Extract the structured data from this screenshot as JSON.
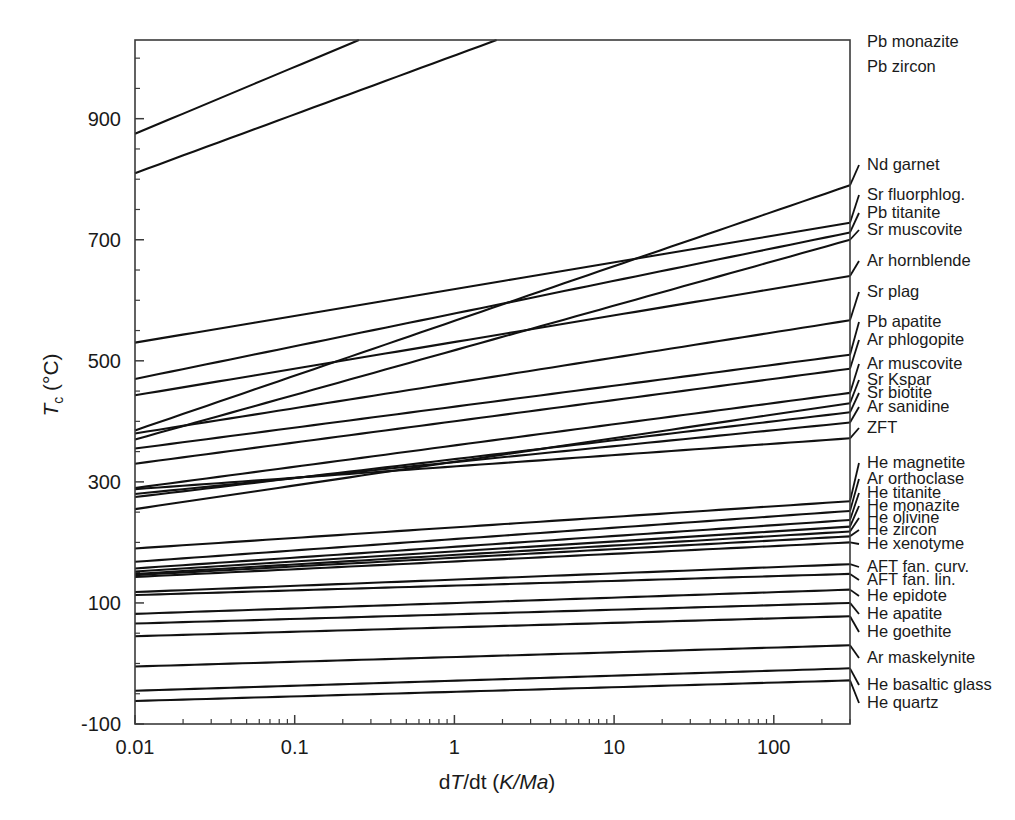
{
  "chart_data": {
    "type": "line",
    "title": "",
    "xlabel": "dT/dt (K/Ma)",
    "ylabel": "Tc (°C)",
    "xscale": "log",
    "xlim": [
      0.01,
      300
    ],
    "ylim": [
      -100,
      1030
    ],
    "grid": false,
    "legend_position": "right-axis-inline",
    "x_ticklabels": [
      "0.01",
      "0.1",
      "1",
      "10",
      "100"
    ],
    "x_tickvalues": [
      0.01,
      0.1,
      1,
      10,
      100
    ],
    "y_ticklabels": [
      "-100",
      "100",
      "300",
      "500",
      "700",
      "900"
    ],
    "y_tickvalues": [
      -100,
      100,
      300,
      500,
      700,
      900
    ],
    "y_minor_step": 50,
    "annotations": [],
    "series": [
      {
        "name": "Pb monazite",
        "label": "Pb monazite",
        "y_at_0.01": 875,
        "y_at_300": 1370,
        "clipped_top": true
      },
      {
        "name": "Pb zircon",
        "label": "Pb zircon",
        "y_at_0.01": 810,
        "y_at_300": 1245,
        "clipped_top": true
      },
      {
        "name": "Nd garnet",
        "label": "Nd garnet",
        "y_at_0.01": 385,
        "y_at_300": 790,
        "clipped_top": false
      },
      {
        "name": "Sr fluorphlog.",
        "label": "Sr fluorphlog.",
        "y_at_0.01": 530,
        "y_at_300": 728,
        "clipped_top": false
      },
      {
        "name": "Pb titanite",
        "label": "Pb titanite",
        "y_at_0.01": 470,
        "y_at_300": 712,
        "clipped_top": false
      },
      {
        "name": "Sr muscovite",
        "label": "Sr muscovite",
        "y_at_0.01": 370,
        "y_at_300": 700,
        "clipped_top": false
      },
      {
        "name": "Ar hornblende",
        "label": "Ar hornblende",
        "y_at_0.01": 443,
        "y_at_300": 640,
        "clipped_top": false
      },
      {
        "name": "Sr plag",
        "label": "Sr plag",
        "y_at_0.01": 380,
        "y_at_300": 567,
        "clipped_top": false
      },
      {
        "name": "Pb apatite",
        "label": "Pb apatite",
        "y_at_0.01": 355,
        "y_at_300": 510,
        "clipped_top": false
      },
      {
        "name": "Ar phlogopite",
        "label": "Ar phlogopite",
        "y_at_0.01": 330,
        "y_at_300": 487,
        "clipped_top": false
      },
      {
        "name": "Ar muscovite",
        "label": "Ar muscovite",
        "y_at_0.01": 290,
        "y_at_300": 447,
        "clipped_top": false
      },
      {
        "name": "Sr Kspar",
        "label": "Sr Kspar",
        "y_at_0.01": 255,
        "y_at_300": 430,
        "clipped_top": false
      },
      {
        "name": "Sr biotite",
        "label": "Sr biotite",
        "y_at_0.01": 275,
        "y_at_300": 415,
        "clipped_top": false
      },
      {
        "name": "Ar sanidine",
        "label": "Ar sanidine",
        "y_at_0.01": 280,
        "y_at_300": 398,
        "clipped_top": false
      },
      {
        "name": "ZFT",
        "label": "ZFT",
        "y_at_0.01": 288,
        "y_at_300": 372,
        "clipped_top": false
      },
      {
        "name": "He magnetite",
        "label": "He magnetite",
        "y_at_0.01": 190,
        "y_at_300": 268,
        "clipped_top": false
      },
      {
        "name": "Ar orthoclase",
        "label": "Ar orthoclase",
        "y_at_0.01": 168,
        "y_at_300": 252,
        "clipped_top": false
      },
      {
        "name": "He titanite",
        "label": "He titanite",
        "y_at_0.01": 157,
        "y_at_300": 237,
        "clipped_top": false
      },
      {
        "name": "He monazite",
        "label": "He monazite",
        "y_at_0.01": 152,
        "y_at_300": 226,
        "clipped_top": false
      },
      {
        "name": "He olivine",
        "label": "He olivine",
        "y_at_0.01": 148,
        "y_at_300": 218,
        "clipped_top": false
      },
      {
        "name": "He zircon",
        "label": "He zircon",
        "y_at_0.01": 146,
        "y_at_300": 210,
        "clipped_top": false
      },
      {
        "name": "He xenotyme",
        "label": "He xenotyme",
        "y_at_0.01": 143,
        "y_at_300": 200,
        "clipped_top": false
      },
      {
        "name": "AFT fan. curv.",
        "label": "AFT fan. curv.",
        "y_at_0.01": 118,
        "y_at_300": 164,
        "clipped_top": false
      },
      {
        "name": "AFT fan. lin.",
        "label": "AFT fan. lin.",
        "y_at_0.01": 113,
        "y_at_300": 148,
        "clipped_top": false
      },
      {
        "name": "He epidote",
        "label": "He epidote",
        "y_at_0.01": 82,
        "y_at_300": 122,
        "clipped_top": false
      },
      {
        "name": "He apatite",
        "label": "He apatite",
        "y_at_0.01": 66,
        "y_at_300": 100,
        "clipped_top": false
      },
      {
        "name": "He goethite",
        "label": "He goethite",
        "y_at_0.01": 45,
        "y_at_300": 78,
        "clipped_top": false
      },
      {
        "name": "Ar maskelynite",
        "label": "Ar maskelynite",
        "y_at_0.01": -5,
        "y_at_300": 30,
        "clipped_top": false
      },
      {
        "name": "He basaltic glass",
        "label": "He basaltic glass",
        "y_at_0.01": -45,
        "y_at_300": -8,
        "clipped_top": false
      },
      {
        "name": "He quartz",
        "label": "He quartz",
        "y_at_0.01": -62,
        "y_at_300": -28,
        "clipped_top": false
      }
    ]
  },
  "axes": {
    "x_title_prefix": "d",
    "x_title_T": "T",
    "x_title_mid": "/dt (",
    "x_title_units": "K/Ma",
    "x_title_suffix": ")",
    "y_title_T": "T",
    "y_title_sub": "c",
    "y_title_units": " (°C)"
  },
  "colors": {
    "curve": "#111111",
    "frame": "#3b3b3b",
    "text": "#1a1a1a",
    "background": "#ffffff"
  }
}
